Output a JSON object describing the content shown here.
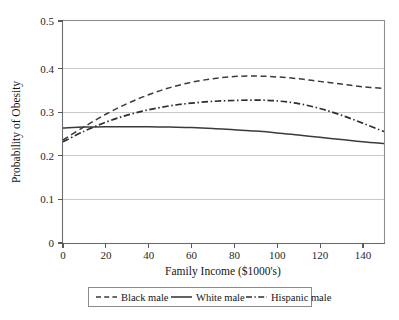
{
  "chart_data": {
    "type": "line",
    "title": "",
    "xlabel": "Family Income ($1000's)",
    "ylabel": "Probability of Obesity",
    "xlim": [
      0,
      150
    ],
    "ylim": [
      0,
      0.5
    ],
    "grid": true,
    "legend_position": "bottom",
    "x_ticks": [
      "0",
      "20",
      "40",
      "60",
      "80",
      "100",
      "120",
      "140"
    ],
    "x_tick_values": [
      0,
      20,
      40,
      60,
      80,
      100,
      120,
      140
    ],
    "y_ticks": [
      "0",
      "0.1",
      "0.2",
      "0.3",
      "0.4",
      "0.5"
    ],
    "y_tick_values": [
      0,
      0.1,
      0.2,
      0.3,
      0.4,
      0.5
    ],
    "x": [
      0,
      10,
      20,
      30,
      40,
      50,
      60,
      70,
      80,
      90,
      100,
      110,
      120,
      130,
      140,
      150
    ],
    "series": [
      {
        "name": "Black male",
        "style": "dashed",
        "color": "#3a3a3a",
        "values": [
          0.232,
          0.262,
          0.29,
          0.314,
          0.334,
          0.35,
          0.362,
          0.37,
          0.375,
          0.376,
          0.374,
          0.37,
          0.364,
          0.358,
          0.352,
          0.348
        ]
      },
      {
        "name": "White male",
        "style": "solid",
        "color": "#3a3a3a",
        "values": [
          0.259,
          0.261,
          0.262,
          0.262,
          0.262,
          0.261,
          0.26,
          0.258,
          0.255,
          0.252,
          0.248,
          0.243,
          0.238,
          0.233,
          0.228,
          0.224
        ]
      },
      {
        "name": "Hispanic male",
        "style": "dashdot",
        "color": "#2e2e2e",
        "values": [
          0.228,
          0.252,
          0.272,
          0.288,
          0.3,
          0.309,
          0.315,
          0.319,
          0.321,
          0.322,
          0.32,
          0.314,
          0.303,
          0.288,
          0.27,
          0.251
        ]
      }
    ]
  },
  "legend": {
    "entries": [
      {
        "label": "Black male"
      },
      {
        "label": "White male"
      },
      {
        "label": "Hispanic male"
      }
    ]
  }
}
